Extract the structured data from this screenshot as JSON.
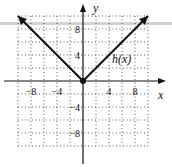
{
  "chart_data": {
    "type": "line",
    "title": "",
    "function_label": "h(x)",
    "xlabel": "x",
    "ylabel": "y",
    "xlim": [
      -10,
      10
    ],
    "ylim": [
      -10,
      10
    ],
    "grid": true,
    "grid_step": 2,
    "x_ticks": [
      -8,
      -4,
      4,
      8
    ],
    "y_ticks": [
      8,
      4,
      -4,
      -8
    ],
    "x_tick_labels": [
      "−8",
      "−4",
      "4",
      "8"
    ],
    "y_tick_labels": [
      "8",
      "4",
      "−4",
      "−8"
    ],
    "series": [
      {
        "name": "h(x)",
        "x": [
          -10,
          0,
          10
        ],
        "y": [
          10,
          0,
          10
        ]
      }
    ],
    "points": [
      {
        "x": 0,
        "y": 0,
        "filled": true
      }
    ]
  }
}
